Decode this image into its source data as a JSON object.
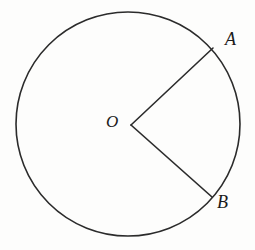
{
  "figure": {
    "kind": "geometry-diagram",
    "background_color": "#fdfdfc",
    "stroke_color": "#2b2b2b",
    "stroke_width": 1.6,
    "canvas": {
      "width": 255,
      "height": 250
    }
  },
  "circle": {
    "center_x": 128,
    "center_y": 124,
    "radius": 112,
    "fill": "none"
  },
  "points": {
    "center": {
      "label": "O",
      "x": 131,
      "y": 125
    },
    "a": {
      "label": "A",
      "x": 213,
      "y": 48
    },
    "b": {
      "label": "B",
      "x": 212,
      "y": 197
    }
  },
  "labels": {
    "center": "O",
    "a": "A",
    "b": "B"
  },
  "segments": [
    {
      "name": "OA",
      "from": "O",
      "to": "A"
    },
    {
      "name": "OB",
      "from": "O",
      "to": "B"
    }
  ]
}
